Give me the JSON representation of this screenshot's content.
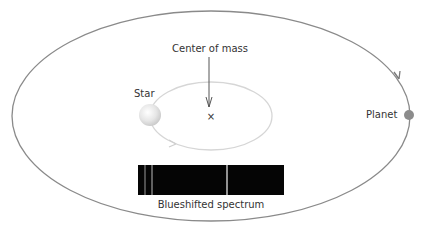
{
  "diagram": {
    "labels": {
      "center_of_mass": "Center of mass",
      "star": "Star",
      "planet": "Planet",
      "spectrum": "Blueshifted spectrum",
      "center_marker": "×"
    },
    "colors": {
      "planet_orbit": "#8a8a8a",
      "star_orbit": "#d6d6d6",
      "planet": "#8c8c8c",
      "star": "#e2e2e2",
      "spectrum_bg": "#050505",
      "spectrum_line": "#d8d8d8",
      "text": "#333333"
    }
  }
}
